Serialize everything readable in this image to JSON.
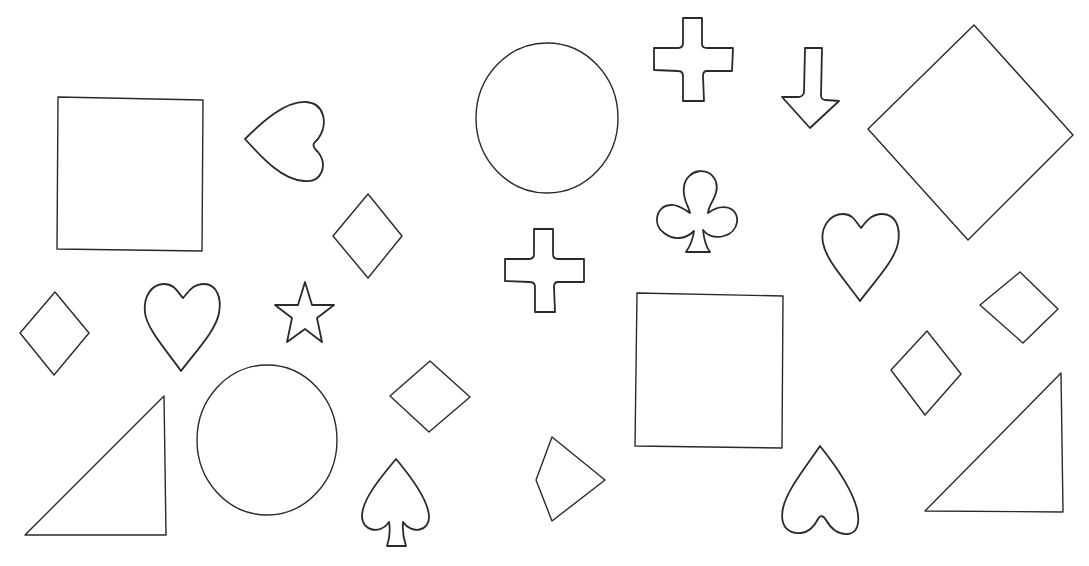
{
  "figure": {
    "background": "#ffffff",
    "stroke_color": "#2a2a2a",
    "shape_counts": {
      "square": 2,
      "circle": 2,
      "diamond": 9,
      "heart": 4,
      "spade": 1,
      "club": 1,
      "cross": 2,
      "star": 1,
      "arrow-down": 1,
      "right-triangle": 2
    },
    "shapes": [
      {
        "type": "square",
        "bbox": [
          57,
          97,
          203,
          251
        ]
      },
      {
        "type": "heart",
        "orientation": "pointing-left",
        "bbox": [
          245,
          101,
          326,
          182
        ]
      },
      {
        "type": "diamond",
        "bbox": [
          332,
          194,
          402,
          278
        ]
      },
      {
        "type": "diamond",
        "bbox": [
          19,
          291,
          89,
          375
        ]
      },
      {
        "type": "heart",
        "orientation": "upright",
        "bbox": [
          144,
          283,
          220,
          371
        ]
      },
      {
        "type": "star",
        "bbox": [
          275,
          281,
          334,
          343
        ]
      },
      {
        "type": "right-triangle",
        "bbox": [
          25,
          395,
          166,
          535
        ]
      },
      {
        "type": "circle",
        "bbox": [
          197,
          365,
          337,
          515
        ]
      },
      {
        "type": "diamond",
        "bbox": [
          390,
          360,
          470,
          432
        ]
      },
      {
        "type": "spade",
        "bbox": [
          362,
          458,
          430,
          546
        ]
      },
      {
        "type": "circle",
        "bbox": [
          476,
          43,
          618,
          193
        ]
      },
      {
        "type": "cross",
        "bbox": [
          653,
          18,
          733,
          101
        ]
      },
      {
        "type": "arrow-down",
        "bbox": [
          781,
          47,
          839,
          128
        ]
      },
      {
        "type": "diamond",
        "bbox": [
          868,
          25,
          1073,
          240
        ]
      },
      {
        "type": "club",
        "bbox": [
          656,
          168,
          739,
          253
        ]
      },
      {
        "type": "cross",
        "bbox": [
          505,
          228,
          585,
          313
        ]
      },
      {
        "type": "heart",
        "orientation": "upright",
        "bbox": [
          821,
          213,
          899,
          301
        ]
      },
      {
        "type": "diamond",
        "bbox": [
          979,
          271,
          1058,
          343
        ]
      },
      {
        "type": "diamond",
        "bbox": [
          891,
          331,
          961,
          415
        ]
      },
      {
        "type": "square",
        "bbox": [
          635,
          293,
          783,
          448
        ]
      },
      {
        "type": "diamond",
        "bbox": [
          535,
          437,
          605,
          521
        ]
      },
      {
        "type": "heart",
        "orientation": "inverted",
        "bbox": [
          780,
          446,
          858,
          534
        ]
      },
      {
        "type": "right-triangle",
        "bbox": [
          925,
          372,
          1063,
          512
        ]
      }
    ]
  }
}
